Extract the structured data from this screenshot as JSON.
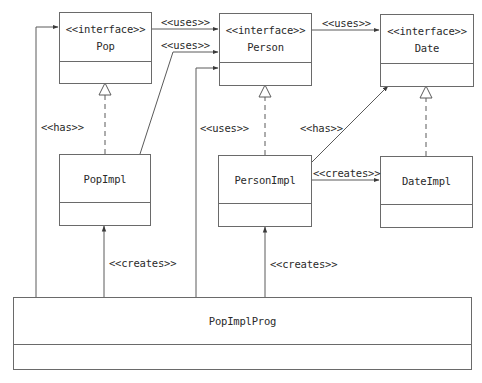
{
  "diagram": {
    "type": "UML class diagram",
    "classes": {
      "pop": {
        "stereotype": "<<interface>>",
        "name": "Pop"
      },
      "person": {
        "stereotype": "<<interface>>",
        "name": "Person"
      },
      "date": {
        "stereotype": "<<interface>>",
        "name": "Date"
      },
      "pop_impl": {
        "name": "PopImpl"
      },
      "person_impl": {
        "name": "PersonImpl"
      },
      "date_impl": {
        "name": "DateImpl"
      },
      "pop_impl_prog": {
        "name": "PopImplProg"
      }
    },
    "relations": [
      {
        "from": "Pop",
        "to": "Person",
        "label": "<<uses>>",
        "kind": "dependency"
      },
      {
        "from": "PopImpl",
        "to": "Person",
        "label": "<<uses>>",
        "kind": "dependency"
      },
      {
        "from": "Person",
        "to": "Date",
        "label": "<<uses>>",
        "kind": "dependency"
      },
      {
        "from": "PopImplProg",
        "to": "Pop",
        "label": "<<has>>",
        "kind": "association"
      },
      {
        "from": "PopImplProg",
        "to": "Person",
        "label": "<<uses>>",
        "kind": "dependency"
      },
      {
        "from": "PersonImpl",
        "to": "Date",
        "label": "<<has>>",
        "kind": "association"
      },
      {
        "from": "PersonImpl",
        "to": "DateImpl",
        "label": "<<creates>>",
        "kind": "dependency"
      },
      {
        "from": "PopImplProg",
        "to": "PopImpl",
        "label": "<<creates>>",
        "kind": "dependency"
      },
      {
        "from": "PopImplProg",
        "to": "PersonImpl",
        "label": "<<creates>>",
        "kind": "dependency"
      },
      {
        "from": "PopImpl",
        "to": "Pop",
        "label": "",
        "kind": "realization"
      },
      {
        "from": "PersonImpl",
        "to": "Person",
        "label": "",
        "kind": "realization"
      },
      {
        "from": "DateImpl",
        "to": "Date",
        "label": "",
        "kind": "realization"
      }
    ],
    "labels": {
      "pop_uses_person": "<<uses>>",
      "popimpl_uses_person": "<<uses>>",
      "person_uses_date": "<<uses>>",
      "prog_has_pop": "<<has>>",
      "prog_uses_person": "<<uses>>",
      "personimpl_has_date": "<<has>>",
      "personimpl_creates_dateimpl": "<<creates>>",
      "prog_creates_popimpl": "<<creates>>",
      "prog_creates_personimpl": "<<creates>>"
    },
    "colors": {
      "line": "#5a5a5a",
      "box_border": "#6a6a6a",
      "text": "#2a2a2a",
      "background": "#ffffff"
    }
  }
}
